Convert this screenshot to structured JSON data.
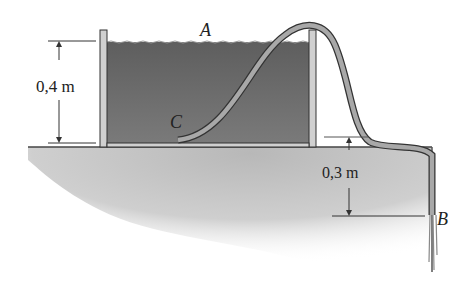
{
  "diagram": {
    "type": "siphon-tank",
    "labels": {
      "point_a": "A",
      "point_b": "B",
      "point_c": "C"
    },
    "dimensions": {
      "water_depth": "0,4 m",
      "outlet_drop": "0,3 m"
    },
    "colors": {
      "water": "#6e6e6e",
      "tank_wall": "#c8c8c8",
      "ground": "#bdbdbd",
      "hose": "#9a9a9a",
      "lines": "#333333"
    }
  }
}
